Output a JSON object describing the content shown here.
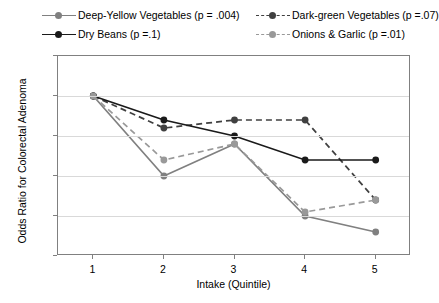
{
  "chart_data": {
    "type": "line",
    "title": "",
    "xlabel": "Intake (Quintile)",
    "ylabel": "Odds Ratio for Colorectal Adenoma",
    "x": [
      1,
      2,
      3,
      4,
      5
    ],
    "xtick_labels": [
      "1",
      "2",
      "3",
      "4",
      "5"
    ],
    "ytick_labels": [
      "0.8",
      "0.85",
      "0.9",
      "0.95",
      "1",
      "1.05"
    ],
    "ytick_values": [
      0.8,
      0.85,
      0.9,
      0.95,
      1.0,
      1.05
    ],
    "ylim": [
      0.8,
      1.05
    ],
    "xlim": [
      0.5,
      5.5
    ],
    "grid": "horizontal",
    "legend_position": "top",
    "series": [
      {
        "name": "Deep-Yellow Vegetables (p = .004)",
        "short_name": "deep-yellow-vegetables",
        "values": [
          1.0,
          0.9,
          0.94,
          0.85,
          0.83
        ],
        "color": "#808080",
        "dash": "solid",
        "marker": "circle"
      },
      {
        "name": "Dark-green Vegetables (p =.07)",
        "short_name": "dark-green-vegetables",
        "values": [
          1.0,
          0.96,
          0.97,
          0.97,
          0.87
        ],
        "color": "#404040",
        "dash": "dashed",
        "marker": "circle"
      },
      {
        "name": "Dry Beans (p =.1)",
        "short_name": "dry-beans",
        "values": [
          1.0,
          0.97,
          0.95,
          0.92,
          0.92
        ],
        "color": "#1a1a1a",
        "dash": "solid",
        "marker": "circle"
      },
      {
        "name": "Onions & Garlic (p =.01)",
        "short_name": "onions-and-garlic",
        "values": [
          1.0,
          0.92,
          0.94,
          0.855,
          0.87
        ],
        "color": "#999999",
        "dash": "dashed",
        "marker": "circle"
      }
    ]
  }
}
